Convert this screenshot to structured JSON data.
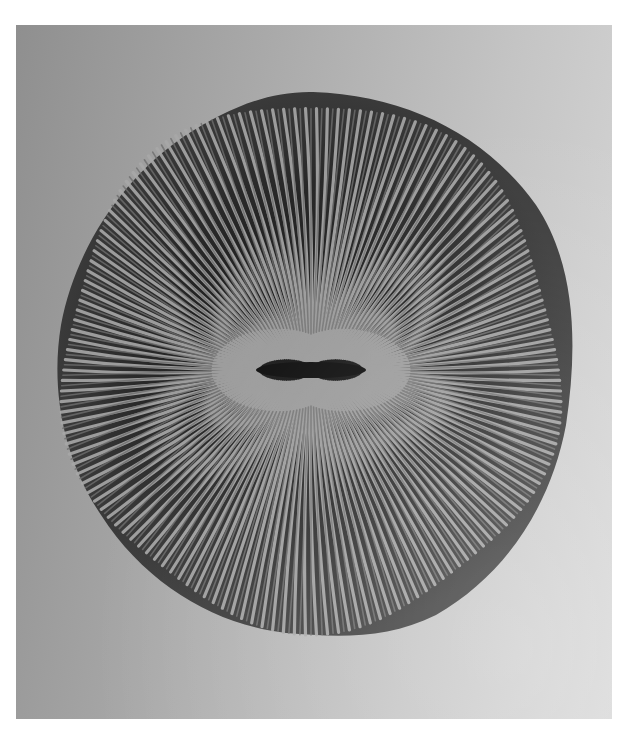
{
  "image": {
    "subject": "Mushroom coral skeleton (Fungia), top view, radiating septa",
    "background_color": "#b0b0b0",
    "disc_color_dark": "#1a1a1a",
    "disc_color_light": "#9a9a9a"
  }
}
